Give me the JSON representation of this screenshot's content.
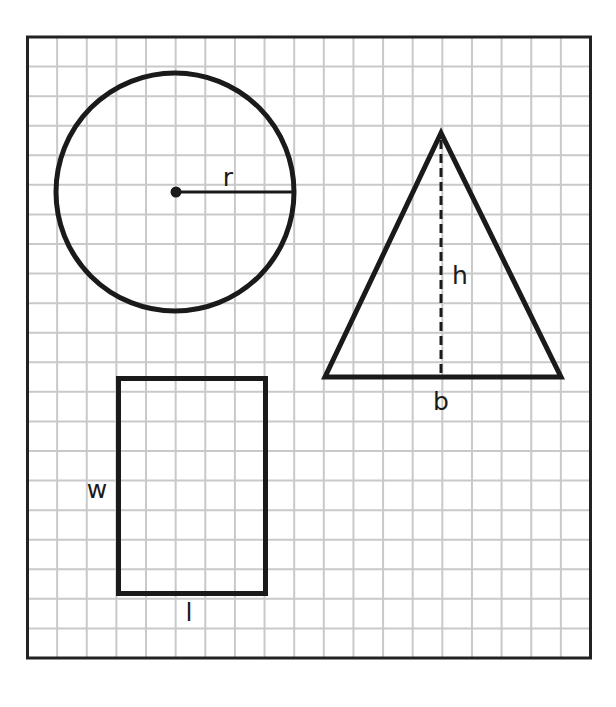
{
  "diagram": {
    "colors": {
      "background": "#ffffff",
      "grid_line": "#c9c9c9",
      "border": "#222222",
      "shape_stroke": "#1a1a1a"
    },
    "grid": {
      "columns": 19,
      "rows": 21
    },
    "shapes": {
      "circle": {
        "radius_label": "r",
        "radius_grid_units": 4
      },
      "triangle": {
        "height_label": "h",
        "base_label": "b",
        "base_grid_units": 8,
        "height_grid_units": 8
      },
      "rectangle": {
        "width_label": "w",
        "length_label": "l",
        "length_grid_units": 5,
        "width_grid_units": 7
      }
    }
  }
}
